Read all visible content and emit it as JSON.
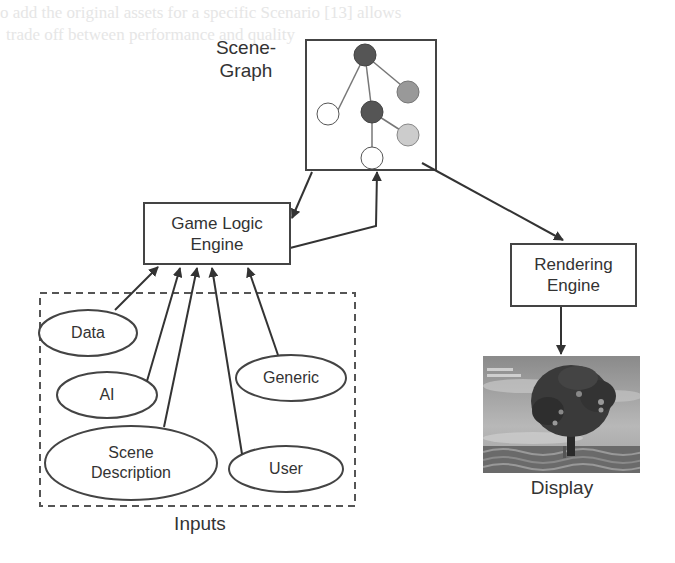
{
  "background_text": {
    "line1": "o add the original assets for a specific Scenario [13] allows",
    "line2": "trade off between performance and quality"
  },
  "scene_graph": {
    "label_line1": "Scene-",
    "label_line2": "Graph",
    "nodes": [
      {
        "id": "root",
        "fill": "#555555"
      },
      {
        "id": "child-gray",
        "fill": "#999999"
      },
      {
        "id": "child-white-left",
        "fill": "#ffffff"
      },
      {
        "id": "child-dark",
        "fill": "#555555"
      },
      {
        "id": "grandchild-light",
        "fill": "#cccccc"
      },
      {
        "id": "grandchild-white",
        "fill": "#ffffff"
      }
    ]
  },
  "game_logic": {
    "line1": "Game Logic",
    "line2": "Engine"
  },
  "rendering": {
    "line1": "Rendering",
    "line2": "Engine"
  },
  "display": {
    "label": "Display",
    "image_desc": "rendered 3D tree scene"
  },
  "inputs": {
    "label": "Inputs",
    "items": [
      {
        "label": "Data"
      },
      {
        "label": "AI"
      },
      {
        "label": "Generic"
      },
      {
        "label_line1": "Scene",
        "label_line2": "Description"
      },
      {
        "label": "User"
      }
    ]
  },
  "colors": {
    "stroke": "#444444",
    "text": "#333333",
    "node_dark": "#555555",
    "node_mid": "#999999",
    "node_light": "#cccccc"
  }
}
